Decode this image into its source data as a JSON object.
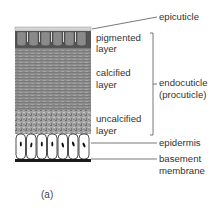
{
  "figure": {
    "caption": "(a)"
  },
  "labels": {
    "epicuticle": "epicuticle",
    "pigmented": [
      "pigmented",
      "layer"
    ],
    "calcified": [
      "calcified",
      "layer"
    ],
    "uncalcified": [
      "uncalcified",
      "layer"
    ],
    "endocuticle": [
      "endocuticle",
      "(procuticle)"
    ],
    "epidermis": "epidermis",
    "basement": [
      "basement",
      "membrane"
    ]
  },
  "colors": {
    "epicuticle_band": "#d4d4d4",
    "pigmented_layer": "#555555",
    "calcified_layer": "#8a8a8a",
    "uncalcified_layer": "#9a9a9a",
    "epidermis_cell": "#ffffff",
    "nucleus": "#111111",
    "basement_membrane": "#1a1a1a",
    "leader_line": "#555555",
    "text": "#333333"
  }
}
